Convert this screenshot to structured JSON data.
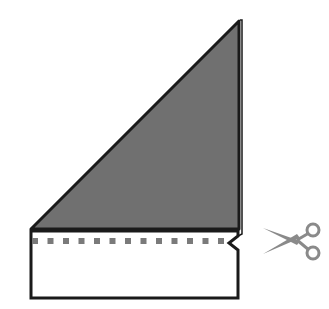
{
  "diagram": {
    "colors": {
      "triangle_fill": "#707070",
      "outline": "#1a1a1a",
      "dash": "#7a7a7a",
      "paper": "#ffffff",
      "scissors": "#8a8a8a"
    },
    "elements": [
      "folded-triangle",
      "paper-strip",
      "cut-line",
      "scissors-icon"
    ]
  }
}
